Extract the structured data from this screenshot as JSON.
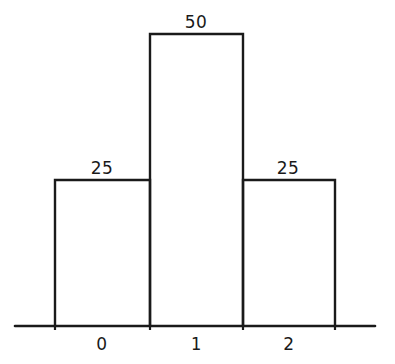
{
  "chart_data": {
    "type": "bar",
    "title": "",
    "subtitle": "",
    "xlabel": "",
    "ylabel": "",
    "categories": [
      "0",
      "1",
      "2"
    ],
    "values": [
      25,
      50,
      25
    ],
    "data_labels": [
      "25",
      "50",
      "25"
    ],
    "ylim": [
      0,
      50
    ],
    "xlim": [
      -0.5,
      2.5
    ],
    "grid": false,
    "legend": null,
    "bar_fill": "none",
    "bar_edge_color": "#1a1a1a",
    "axis_color": "#1a1a1a",
    "background": "#ffffff"
  },
  "geometry": {
    "baseline_y": 326,
    "axis_x_start": 15,
    "axis_x_end": 375,
    "bars": [
      {
        "category": "0",
        "x_left": 55,
        "x_right": 150,
        "y_top": 180,
        "label": "25"
      },
      {
        "category": "1",
        "x_left": 150,
        "x_right": 243,
        "y_top": 34,
        "label": "50"
      },
      {
        "category": "2",
        "x_left": 243,
        "x_right": 335,
        "y_top": 180,
        "label": "25"
      }
    ],
    "value_label_positions": [
      {
        "cx": 102,
        "y": 158
      },
      {
        "cx": 196,
        "y": 12
      },
      {
        "cx": 288,
        "y": 158
      }
    ],
    "tick_label_positions": [
      {
        "cx": 102,
        "y": 334
      },
      {
        "cx": 196,
        "y": 334
      },
      {
        "cx": 289,
        "y": 334
      }
    ]
  }
}
